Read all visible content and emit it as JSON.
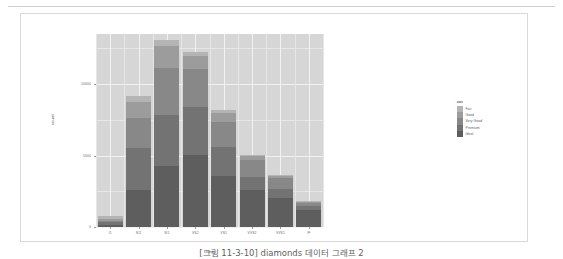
{
  "figure": {
    "caption": "[그림 11-3-10] diamonds 데이터 그래프 2"
  },
  "legend": {
    "title": "cut",
    "items": [
      {
        "label": "Fair",
        "color": "#b4b4b4"
      },
      {
        "label": "Good",
        "color": "#9c9c9c"
      },
      {
        "label": "Very Good",
        "color": "#888888"
      },
      {
        "label": "Premium",
        "color": "#737373"
      },
      {
        "label": "Ideal",
        "color": "#5e5e5e"
      }
    ]
  },
  "chart_data": {
    "type": "bar",
    "stacked": true,
    "title": "",
    "xlabel": "clarity",
    "ylabel": "count",
    "ylim": [
      0,
      13500
    ],
    "yticks": [
      0,
      5000,
      10000
    ],
    "ytick_labels": [
      "0",
      "5000",
      "10000"
    ],
    "grid": true,
    "legend_position": "right",
    "panel_background": "#d6d6d6",
    "categories": [
      "I1",
      "SI2",
      "SI1",
      "VS2",
      "VS1",
      "VVS2",
      "VVS1",
      "IF"
    ],
    "series": [
      {
        "name": "Ideal",
        "color": "#5e5e5e",
        "values": [
          146,
          2598,
          4282,
          5071,
          3589,
          2606,
          2047,
          1212
        ]
      },
      {
        "name": "Premium",
        "color": "#737373",
        "values": [
          205,
          2949,
          3575,
          3357,
          1989,
          870,
          616,
          230
        ]
      },
      {
        "name": "Very Good",
        "color": "#888888",
        "values": [
          84,
          2100,
          3240,
          2591,
          1775,
          1235,
          789,
          268
        ]
      },
      {
        "name": "Good",
        "color": "#9c9c9c",
        "values": [
          96,
          1081,
          1560,
          978,
          648,
          286,
          186,
          71
        ]
      },
      {
        "name": "Fair",
        "color": "#b4b4b4",
        "values": [
          210,
          466,
          408,
          261,
          170,
          69,
          17,
          9
        ]
      }
    ],
    "totals": [
      741,
      9194,
      13065,
      12258,
      8171,
      5066,
      3655,
      1790
    ]
  }
}
